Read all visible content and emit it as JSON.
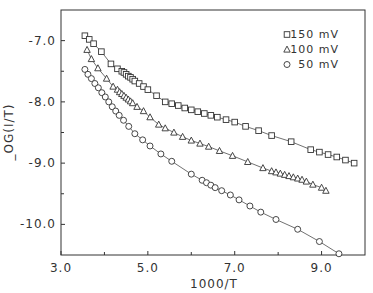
{
  "chart_data": {
    "type": "scatter",
    "title": "",
    "xlabel": "1000/T",
    "ylabel": "_OG(I/T)",
    "xlim": [
      3.0,
      10.0
    ],
    "ylim": [
      -10.5,
      -6.5
    ],
    "xticks": [
      3.0,
      5.0,
      7.0,
      9.0
    ],
    "xtick_labels": [
      "3.0",
      "5.0",
      "7.0",
      "9.0"
    ],
    "xminor_ticks": [
      4.0,
      6.0,
      8.0
    ],
    "yticks": [
      -7.0,
      -8.0,
      -9.0,
      -10.0
    ],
    "ytick_labels": [
      "-7.0",
      "-8.0",
      "-9.0",
      "-10.0"
    ],
    "yminor_ticks": [
      -7.5,
      -8.5,
      -9.5
    ],
    "grid": false,
    "legend_position": "upper right",
    "series": [
      {
        "name": "150 mV",
        "marker": "square",
        "x": [
          3.55,
          3.65,
          3.75,
          3.93,
          4.15,
          4.3,
          4.4,
          4.45,
          4.5,
          4.55,
          4.6,
          4.65,
          4.7,
          4.8,
          4.9,
          5.0,
          5.2,
          5.4,
          5.55,
          5.7,
          5.85,
          6.0,
          6.15,
          6.3,
          6.45,
          6.6,
          6.8,
          7.0,
          7.25,
          7.55,
          7.85,
          8.3,
          8.75,
          8.95,
          9.15,
          9.35,
          9.55,
          9.75
        ],
        "y": [
          -6.92,
          -6.98,
          -7.05,
          -7.18,
          -7.38,
          -7.46,
          -7.5,
          -7.52,
          -7.55,
          -7.58,
          -7.6,
          -7.63,
          -7.66,
          -7.7,
          -7.75,
          -7.8,
          -7.9,
          -8.0,
          -8.03,
          -8.06,
          -8.1,
          -8.13,
          -8.16,
          -8.19,
          -8.22,
          -8.25,
          -8.29,
          -8.33,
          -8.4,
          -8.47,
          -8.55,
          -8.65,
          -8.78,
          -8.82,
          -8.86,
          -8.9,
          -8.95,
          -9.0
        ]
      },
      {
        "name": "100 mV",
        "marker": "triangle",
        "x": [
          3.6,
          3.7,
          3.85,
          4.05,
          4.2,
          4.3,
          4.35,
          4.4,
          4.45,
          4.5,
          4.55,
          4.6,
          4.65,
          4.75,
          4.9,
          5.05,
          5.25,
          5.4,
          5.6,
          5.8,
          6.0,
          6.2,
          6.4,
          6.65,
          6.95,
          7.3,
          7.65,
          7.85,
          7.95,
          8.05,
          8.15,
          8.25,
          8.35,
          8.45,
          8.55,
          8.65,
          8.8,
          9.0,
          9.1
        ],
        "y": [
          -7.15,
          -7.3,
          -7.45,
          -7.62,
          -7.75,
          -7.8,
          -7.84,
          -7.87,
          -7.9,
          -7.93,
          -7.96,
          -7.99,
          -8.02,
          -8.08,
          -8.15,
          -8.25,
          -8.37,
          -8.43,
          -8.5,
          -8.57,
          -8.63,
          -8.68,
          -8.73,
          -8.8,
          -8.88,
          -8.98,
          -9.08,
          -9.13,
          -9.15,
          -9.17,
          -9.19,
          -9.21,
          -9.23,
          -9.25,
          -9.27,
          -9.3,
          -9.35,
          -9.4,
          -9.45
        ]
      },
      {
        "name": "50 mV",
        "marker": "circle",
        "x": [
          3.55,
          3.62,
          3.7,
          3.78,
          3.86,
          3.94,
          4.02,
          4.1,
          4.18,
          4.26,
          4.34,
          4.44,
          4.56,
          4.7,
          4.88,
          5.05,
          5.3,
          5.55,
          6.0,
          6.25,
          6.35,
          6.45,
          6.55,
          6.7,
          6.9,
          7.1,
          7.35,
          7.6,
          7.95,
          8.45,
          8.95,
          9.4
        ],
        "y": [
          -7.47,
          -7.55,
          -7.62,
          -7.7,
          -7.77,
          -7.85,
          -7.92,
          -8.0,
          -8.08,
          -8.15,
          -8.22,
          -8.3,
          -8.4,
          -8.52,
          -8.62,
          -8.72,
          -8.85,
          -8.97,
          -9.18,
          -9.28,
          -9.32,
          -9.36,
          -9.4,
          -9.45,
          -9.52,
          -9.6,
          -9.7,
          -9.8,
          -9.92,
          -10.08,
          -10.28,
          -10.48
        ]
      }
    ]
  }
}
